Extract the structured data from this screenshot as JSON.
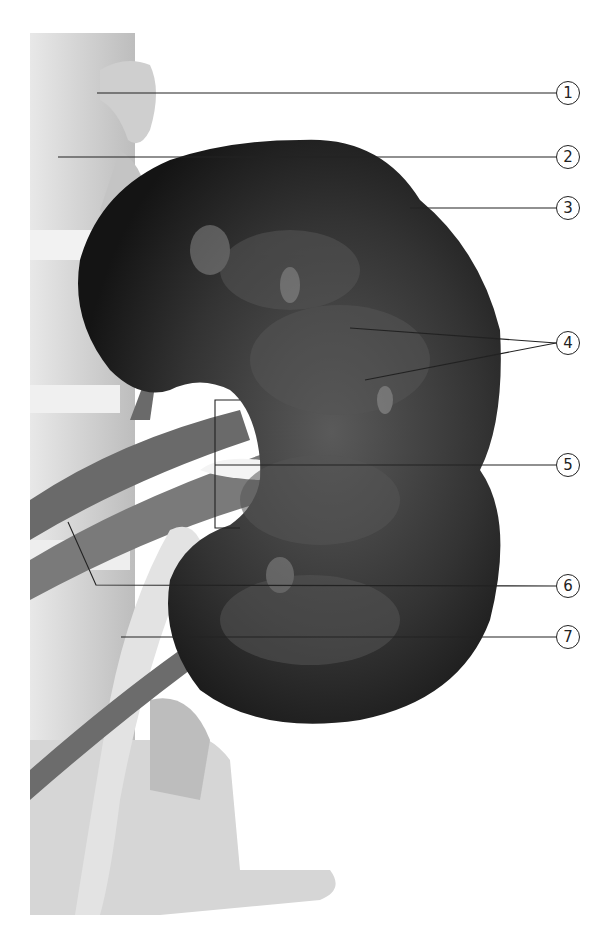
{
  "figure": {
    "colors": {
      "background": "#ffffff",
      "kidney_dark": "#1c1c1c",
      "kidney_inner": "#4a4a4a",
      "bone": "#c9c9c9",
      "bone_light": "#e6e6e6",
      "vessel": "#6e6e6e",
      "leader_line": "#222222"
    }
  },
  "callouts": [
    {
      "number": "1",
      "label_x": 568,
      "label_y": 93
    },
    {
      "number": "2",
      "label_x": 568,
      "label_y": 157
    },
    {
      "number": "3",
      "label_x": 568,
      "label_y": 208
    },
    {
      "number": "4",
      "label_x": 568,
      "label_y": 343
    },
    {
      "number": "5",
      "label_x": 568,
      "label_y": 465
    },
    {
      "number": "6",
      "label_x": 568,
      "label_y": 586
    },
    {
      "number": "7",
      "label_x": 568,
      "label_y": 637
    }
  ]
}
